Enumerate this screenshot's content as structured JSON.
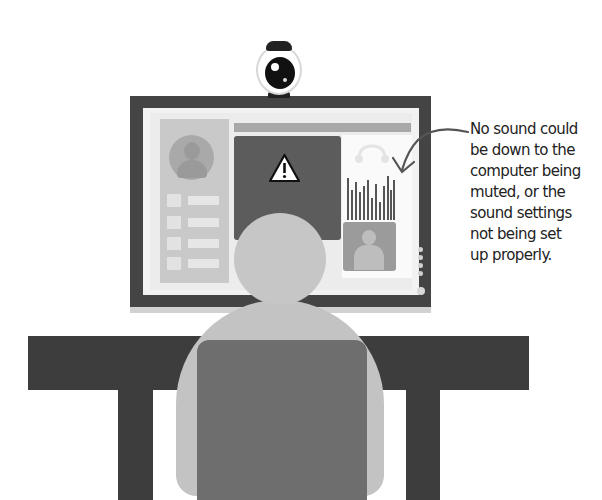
{
  "illustration": {
    "description": "Person at a computer with a video call showing a warning; callout explains a no-sound issue",
    "colors": {
      "bezel": "#444444",
      "desk": "#3d3d3d",
      "chair": "#6e6e6e",
      "person": "#c4c4c4",
      "video_area": "#5c5c5c",
      "screen": "#f2f2f2"
    },
    "icons": [
      "webcam-icon",
      "warning-icon",
      "headset-icon",
      "bar-chart-icon",
      "person-avatar-icon"
    ]
  },
  "screen": {
    "menu_item_count": 4,
    "bar_chart_heights": [
      42,
      30,
      38,
      28,
      34,
      40,
      22,
      36,
      18,
      34,
      44,
      30,
      40
    ],
    "side_dots": 4
  },
  "callout": {
    "lines": [
      "No sound could",
      "be down to the",
      "computer being",
      "muted, or the",
      "sound settings",
      "not being set",
      "up properly."
    ]
  }
}
